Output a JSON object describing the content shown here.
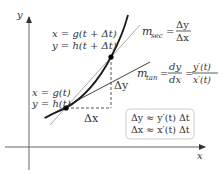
{
  "axes": {
    "x_label": "x",
    "y_label": "y"
  },
  "points": {
    "lower": {
      "eq_x": "x = g(t)",
      "eq_y": "y = h(t)"
    },
    "upper": {
      "eq_x": "x = g(t + Δt)",
      "eq_y": "y = h(t + Δt)"
    }
  },
  "increments": {
    "dx_label": "Δx",
    "dy_label": "Δy"
  },
  "secant": {
    "m": "m",
    "sub": "sec",
    "eq": "=",
    "num": "Δy",
    "den": "Δx"
  },
  "tangent": {
    "m": "m",
    "sub": "tan",
    "eq1": "=",
    "num1": "dy",
    "den1": "dx",
    "eq2": "=",
    "num2": "y′(t)",
    "den2": "x′(t)"
  },
  "approx_box": {
    "line1": "Δy ≈ y′(t) Δt",
    "line2": "Δx ≈ x′(t) Δt"
  },
  "colors": {
    "axis": "#666666",
    "curve": "#1a1a1a",
    "secant": "#aaaaaa",
    "tangent": "#444444",
    "text": "#333333",
    "box_border": "#cccccc"
  }
}
